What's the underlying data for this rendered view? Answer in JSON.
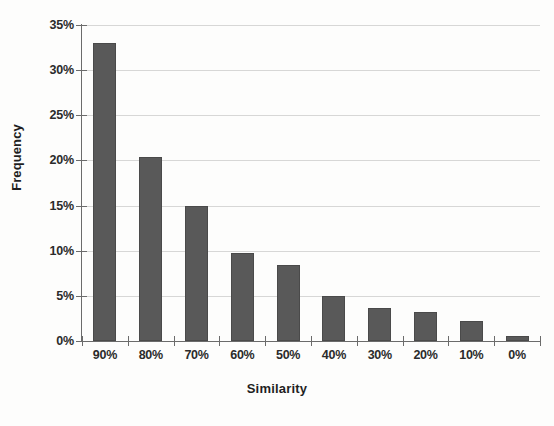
{
  "chart_data": {
    "type": "bar",
    "title": "",
    "xlabel": "Similarity",
    "ylabel": "Frequency",
    "categories": [
      "90%",
      "80%",
      "70%",
      "60%",
      "50%",
      "40%",
      "30%",
      "20%",
      "10%",
      "0%"
    ],
    "values": [
      33.0,
      20.4,
      14.9,
      9.8,
      8.4,
      5.0,
      3.7,
      3.2,
      2.2,
      0.6
    ],
    "value_unit": "percent",
    "ylim": [
      0,
      35
    ],
    "ytick_labels": [
      "0%",
      "5%",
      "10%",
      "15%",
      "20%",
      "25%",
      "30%",
      "35%"
    ],
    "ytick_values": [
      0,
      5,
      10,
      15,
      20,
      25,
      30,
      35
    ],
    "grid": "horizontal",
    "legend": "none",
    "bar_color": "#595959",
    "gridline_color": "#c9c9c9",
    "axis_color": "#6b6b6b",
    "background_color": "#fdfdfc"
  }
}
